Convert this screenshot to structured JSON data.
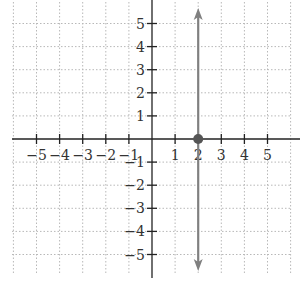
{
  "chart_data": {
    "type": "line",
    "title": "",
    "xlabel": "",
    "ylabel": "",
    "xlim": [
      -6,
      6
    ],
    "ylim": [
      -6,
      6
    ],
    "grid": true,
    "grid_style": "dotted",
    "x_ticks": [
      -5,
      -4,
      -3,
      -2,
      -1,
      1,
      2,
      3,
      4,
      5
    ],
    "y_ticks": [
      -5,
      -4,
      -3,
      -2,
      -1,
      1,
      2,
      3,
      4,
      5
    ],
    "x_tick_labels": [
      "−5",
      "−4",
      "−3",
      "−2",
      "−1",
      "1",
      "2",
      "3",
      "4",
      "5"
    ],
    "y_tick_labels": [
      "−5",
      "−4",
      "−3",
      "−2",
      "−1",
      "1",
      "2",
      "3",
      "4",
      "5"
    ],
    "series": [
      {
        "name": "x = 2",
        "kind": "vertical-line",
        "x": [
          2,
          2
        ],
        "y": [
          -6,
          6
        ],
        "arrows": "both",
        "color": "#808080"
      }
    ],
    "points": [
      {
        "x": 2,
        "y": 0,
        "label": "x-intercept",
        "color": "#555555"
      }
    ]
  },
  "colors": {
    "axis": "#222222",
    "grid": "#b8b8b8",
    "line": "#808080",
    "point": "#555555"
  }
}
